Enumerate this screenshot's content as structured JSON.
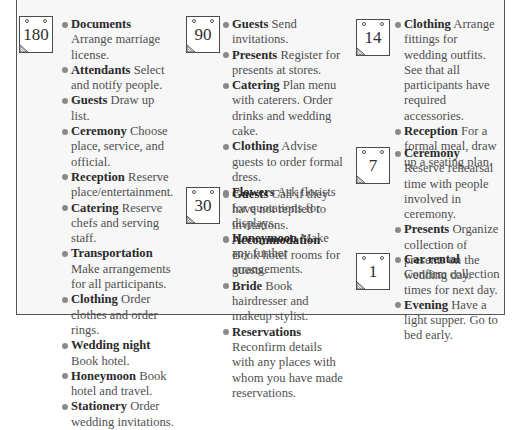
{
  "document": {
    "type": "wedding planning countdown checklist",
    "colors": {
      "frame_border": "#555555",
      "frame_background": "#f7f7f7",
      "bullet": "#8a8a8a",
      "keyword_text": "#2a2a2a",
      "body_text": "#4f4f4f"
    },
    "columns": [
      {
        "groups": [
          {
            "days_before": "180",
            "icon": "calendar-page-icon",
            "items": [
              {
                "keyword": "Documents",
                "description": "Arrange marriage license."
              },
              {
                "keyword": "Attendants",
                "description": "Select and notify people."
              },
              {
                "keyword": "Guests",
                "description": "Draw up list."
              },
              {
                "keyword": "Ceremony",
                "description": "Choose place, service, and official."
              },
              {
                "keyword": "Reception",
                "description": "Reserve place/entertainment."
              },
              {
                "keyword": "Catering",
                "description": "Reserve chefs and serving staff."
              },
              {
                "keyword": "Transportation",
                "description": "Make arrangements for all participants."
              },
              {
                "keyword": "Clothing",
                "description": "Order clothes and order rings."
              },
              {
                "keyword": "Wedding night",
                "description": "Book hotel."
              },
              {
                "keyword": "Honeymoon",
                "description": "Book hotel and travel."
              },
              {
                "keyword": "Stationery",
                "description": "Order wedding invitations."
              }
            ]
          }
        ]
      },
      {
        "groups": [
          {
            "days_before": "90",
            "icon": "calendar-page-icon",
            "items": [
              {
                "keyword": "Guests",
                "description": "Send invitations."
              },
              {
                "keyword": "Presents",
                "description": "Register for presents at stores."
              },
              {
                "keyword": "Catering",
                "description": "Plan menu with caterers. Order drinks and wedding cake."
              },
              {
                "keyword": "Clothing",
                "description": "Advise guests to order formal dress."
              },
              {
                "keyword": "Flowers",
                "description": "Ask florists for quotations for displays."
              },
              {
                "keyword": "Honeymoon",
                "description": "Make any further arrangements."
              }
            ]
          },
          {
            "days_before": "30",
            "icon": "calendar-page-icon",
            "items": [
              {
                "keyword": "Guests",
                "description": "Call if they have not replied to invitations."
              },
              {
                "keyword": "Accommodation",
                "description": "Book hotel rooms for guests."
              },
              {
                "keyword": "Bride",
                "description": "Book hairdresser and makeup stylist."
              },
              {
                "keyword": "Reservations",
                "description": "Reconfirm details with any places with whom you have made reservations."
              }
            ]
          }
        ]
      },
      {
        "groups": [
          {
            "days_before": "14",
            "icon": "calendar-page-icon",
            "items": [
              {
                "keyword": "Clothing",
                "description": "Arrange fittings for wedding outfits. See that all participants have required accessories."
              },
              {
                "keyword": "Reception",
                "description": "For a formal meal, draw up a seating plan."
              }
            ]
          },
          {
            "days_before": "7",
            "icon": "calendar-page-icon",
            "items": [
              {
                "keyword": "Ceremony",
                "description": "Reserve rehearsal time with people involved in ceremony."
              },
              {
                "keyword": "Presents",
                "description": "Organize collection of presents on the wedding day."
              }
            ]
          },
          {
            "days_before": "1",
            "icon": "calendar-page-icon",
            "items": [
              {
                "keyword": "Car rental",
                "description": "Confirm collection times for next day."
              },
              {
                "keyword": "Evening",
                "description": "Have a light supper. Go to bed early."
              }
            ]
          }
        ]
      }
    ]
  }
}
